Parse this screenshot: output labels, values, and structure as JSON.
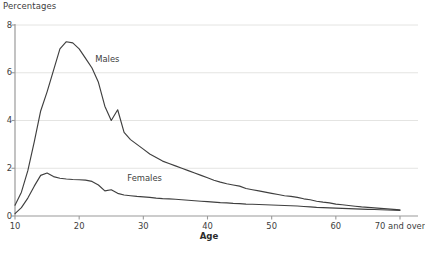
{
  "axis": {
    "y_title": "Percentages",
    "x_title": "Age",
    "y_ticks": [
      "0",
      "2",
      "4",
      "6",
      "8"
    ],
    "x_ticks": [
      "10",
      "20",
      "30",
      "40",
      "50",
      "60",
      "70 and over"
    ]
  },
  "series_labels": {
    "males": "Males",
    "females": "Females"
  },
  "footnote": "",
  "colors": {
    "line": "#3f3f3f",
    "grid": "#e4e4e2",
    "axis": "#9a9a9a",
    "text": "#3d3d3d"
  },
  "chart_data": {
    "type": "line",
    "title": "",
    "xlabel": "Age",
    "ylabel": "Percentages",
    "xlim": [
      10,
      70
    ],
    "ylim": [
      0,
      8
    ],
    "grid": true,
    "legend": "inline-annotations",
    "x": [
      10,
      11,
      12,
      13,
      14,
      15,
      16,
      17,
      18,
      19,
      20,
      21,
      22,
      23,
      24,
      25,
      26,
      27,
      28,
      29,
      30,
      31,
      32,
      33,
      34,
      35,
      36,
      37,
      38,
      39,
      40,
      41,
      42,
      43,
      44,
      45,
      46,
      47,
      48,
      49,
      50,
      51,
      52,
      53,
      54,
      55,
      56,
      57,
      58,
      59,
      60,
      61,
      62,
      63,
      64,
      65,
      66,
      67,
      68,
      69,
      70
    ],
    "x_tick_values": [
      10,
      20,
      30,
      40,
      50,
      60,
      70
    ],
    "x_tick_labels": [
      "10",
      "20",
      "30",
      "40",
      "50",
      "60",
      "70 and over"
    ],
    "y_tick_values": [
      0,
      2,
      4,
      6,
      8
    ],
    "series": [
      {
        "name": "Males",
        "values": [
          0.45,
          1.0,
          1.9,
          3.1,
          4.4,
          5.2,
          6.1,
          7.0,
          7.3,
          7.25,
          7.0,
          6.6,
          6.2,
          5.6,
          4.6,
          4.0,
          4.45,
          3.5,
          3.2,
          3.0,
          2.8,
          2.6,
          2.45,
          2.3,
          2.2,
          2.1,
          2.0,
          1.9,
          1.8,
          1.7,
          1.6,
          1.5,
          1.42,
          1.35,
          1.3,
          1.25,
          1.15,
          1.1,
          1.05,
          1.0,
          0.95,
          0.9,
          0.85,
          0.82,
          0.78,
          0.72,
          0.68,
          0.62,
          0.58,
          0.55,
          0.5,
          0.47,
          0.44,
          0.41,
          0.38,
          0.36,
          0.34,
          0.32,
          0.3,
          0.28,
          0.26
        ]
      },
      {
        "name": "Females",
        "values": [
          0.1,
          0.35,
          0.75,
          1.25,
          1.7,
          1.8,
          1.65,
          1.58,
          1.55,
          1.53,
          1.52,
          1.5,
          1.45,
          1.3,
          1.05,
          1.1,
          0.95,
          0.88,
          0.85,
          0.82,
          0.8,
          0.78,
          0.75,
          0.73,
          0.72,
          0.7,
          0.68,
          0.66,
          0.64,
          0.62,
          0.6,
          0.58,
          0.56,
          0.55,
          0.53,
          0.52,
          0.5,
          0.49,
          0.48,
          0.47,
          0.46,
          0.45,
          0.44,
          0.43,
          0.42,
          0.4,
          0.38,
          0.36,
          0.35,
          0.34,
          0.33,
          0.32,
          0.31,
          0.3,
          0.29,
          0.28,
          0.27,
          0.26,
          0.25,
          0.24,
          0.23
        ]
      }
    ],
    "annotations": [
      {
        "text": "Males",
        "x": 22.5,
        "y": 6.55
      },
      {
        "text": "Females",
        "x": 27.5,
        "y": 1.55
      }
    ]
  }
}
